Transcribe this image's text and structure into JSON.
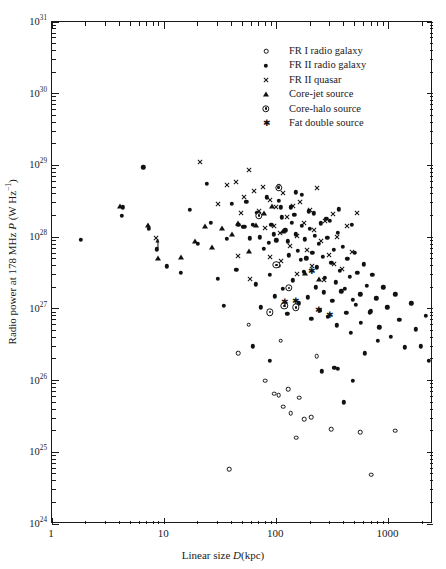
{
  "axes": {
    "x_title_prefix": "Linear size ",
    "x_title_symbol": "D",
    "x_title_suffix": "(kpc)",
    "y_title_prefix": "Radio power at 178 MHz ",
    "y_title_symbol": "P",
    "y_title_suffix": " (W Hz",
    "y_title_exp": "−1",
    "y_title_close": ")",
    "x_ticklabels": [
      "1",
      "10",
      "100",
      "1000"
    ],
    "y_ticklabels": [
      "10",
      "10",
      "10",
      "10",
      "10",
      "10",
      "10",
      "10"
    ],
    "y_tickexps": [
      "24",
      "25",
      "26",
      "27",
      "28",
      "29",
      "30",
      "31"
    ]
  },
  "legend": {
    "entries": [
      {
        "label": "FR I radio galaxy",
        "marker": "open-circle"
      },
      {
        "label": "FR II radio galaxy",
        "marker": "filled-circle"
      },
      {
        "label": "FR II quasar",
        "marker": "cross"
      },
      {
        "label": "Core-jet source",
        "marker": "triangle"
      },
      {
        "label": "Core-halo source",
        "marker": "core-halo"
      },
      {
        "label": "Fat double source",
        "marker": "star"
      }
    ]
  },
  "chart_data": {
    "type": "scatter",
    "title": "",
    "xlabel": "Linear size D (kpc)",
    "ylabel": "Radio power at 178 MHz P (W Hz^-1)",
    "xscale": "log",
    "yscale": "log",
    "xlim": [
      1,
      2500
    ],
    "ylim": [
      1e+24,
      1e+31
    ],
    "grid": false,
    "legend_position": "top-right",
    "series": [
      {
        "name": "FR I radio galaxy",
        "marker": "open-circle",
        "points": [
          [
            57,
            6e+26
          ],
          [
            110,
            3.6e+26
          ],
          [
            46,
            2.4e+26
          ],
          [
            230,
            2.2e+26
          ],
          [
            80,
            1e+26
          ],
          [
            128,
            7.6e+25
          ],
          [
            96,
            6.6e+25
          ],
          [
            105,
            6.3e+25
          ],
          [
            160,
            5.8e+25
          ],
          [
            116,
            4.3e+25
          ],
          [
            135,
            3.5e+25
          ],
          [
            205,
            3.1e+25
          ],
          [
            178,
            2.9e+25
          ],
          [
            150,
            1.6e+25
          ],
          [
            310,
            2.1e+25
          ],
          [
            560,
            1.9e+25
          ],
          [
            1150,
            2e+25
          ],
          [
            700,
            4.9e+24
          ],
          [
            38,
            5.8e+24
          ]
        ]
      },
      {
        "name": "FR II radio galaxy",
        "marker": "filled-circle",
        "points": [
          [
            1.8,
            9.2e+27
          ],
          [
            6.5,
            9.4e+28
          ],
          [
            4.2,
            2e+28
          ],
          [
            4.3,
            2.6e+28
          ],
          [
            7.3,
            1.3e+28
          ],
          [
            8.6,
            6.8e+27
          ],
          [
            10.5,
            3.9e+27
          ],
          [
            14,
            3.2e+27
          ],
          [
            24,
            5.5e+28
          ],
          [
            40,
            2.9e+28
          ],
          [
            46,
            1.5e+28
          ],
          [
            50,
            1.4e+28
          ],
          [
            52,
            1.4e+28
          ],
          [
            58,
            9.6e+27
          ],
          [
            62,
            1.5e+28
          ],
          [
            71,
            1e+28
          ],
          [
            77,
            6.9e+27
          ],
          [
            86,
            8.4e+27
          ],
          [
            90,
            1.5e+28
          ],
          [
            95,
            1.1e+28
          ],
          [
            100,
            9e+27
          ],
          [
            104,
            4e+27
          ],
          [
            110,
            2.6e+28
          ],
          [
            112,
            1.9e+28
          ],
          [
            120,
            1.25e+28
          ],
          [
            126,
            8.8e+27
          ],
          [
            130,
            5.6e+27
          ],
          [
            138,
            1.6e+28
          ],
          [
            145,
            2.05e+28
          ],
          [
            150,
            1.1e+28
          ],
          [
            156,
            6.4e+27
          ],
          [
            165,
            4.8e+27
          ],
          [
            170,
            1.45e+28
          ],
          [
            180,
            9.3e+27
          ],
          [
            186,
            5.1e+27
          ],
          [
            195,
            2.3e+28
          ],
          [
            200,
            1.3e+28
          ],
          [
            210,
            6.1e+27
          ],
          [
            220,
            1.05e+28
          ],
          [
            230,
            3.8e+27
          ],
          [
            240,
            8.1e+27
          ],
          [
            250,
            1.55e+28
          ],
          [
            260,
            5.3e+27
          ],
          [
            270,
            2.7e+27
          ],
          [
            285,
            9.8e+27
          ],
          [
            300,
            1.7e+28
          ],
          [
            310,
            4.4e+27
          ],
          [
            325,
            6.7e+27
          ],
          [
            340,
            2.35e+27
          ],
          [
            355,
            1.15e+28
          ],
          [
            370,
            3.4e+27
          ],
          [
            390,
            7.4e+27
          ],
          [
            410,
            1.9e+27
          ],
          [
            430,
            5e+27
          ],
          [
            455,
            2.8e+27
          ],
          [
            480,
            1.35e+27
          ],
          [
            500,
            6e+27
          ],
          [
            530,
            3.2e+27
          ],
          [
            560,
            1.6e+27
          ],
          [
            600,
            4.2e+27
          ],
          [
            640,
            2.1e+27
          ],
          [
            680,
            9e+26
          ],
          [
            720,
            3e+27
          ],
          [
            780,
            1.4e+27
          ],
          [
            830,
            5.5e+26
          ],
          [
            900,
            2e+27
          ],
          [
            980,
            1.05e+27
          ],
          [
            1050,
            4.1e+26
          ],
          [
            1150,
            1.6e+27
          ],
          [
            1250,
            7e+26
          ],
          [
            1400,
            2.9e+26
          ],
          [
            1600,
            1.2e+27
          ],
          [
            1750,
            5.2e+26
          ],
          [
            1950,
            3e+26
          ],
          [
            2150,
            8e+26
          ],
          [
            2300,
            1.9e+26
          ],
          [
            30,
            2.6e+27
          ],
          [
            34,
            1.1e+27
          ],
          [
            44,
            3.5e+27
          ],
          [
            66,
            2.2e+27
          ],
          [
            73,
            1.05e+27
          ],
          [
            88,
            3e+27
          ],
          [
            97,
            1.5e+27
          ],
          [
            115,
            1.9e+27
          ],
          [
            125,
            8.5e+26
          ],
          [
            140,
            2.5e+27
          ],
          [
            158,
            1.2e+27
          ],
          [
            175,
            3.3e+27
          ],
          [
            190,
            1.45e+27
          ],
          [
            205,
            7.2e+26
          ],
          [
            225,
            2e+27
          ],
          [
            245,
            9.5e+26
          ],
          [
            265,
            1.7e+27
          ],
          [
            290,
            7.8e+26
          ],
          [
            315,
            1.3e+27
          ],
          [
            345,
            5.9e+26
          ],
          [
            380,
            1.75e+27
          ],
          [
            420,
            8.8e+26
          ],
          [
            465,
            4.6e+26
          ],
          [
            510,
            1.15e+27
          ],
          [
            570,
            6.4e+26
          ],
          [
            620,
            2.4e+26
          ],
          [
            700,
            9.2e+26
          ],
          [
            800,
            3.6e+26
          ],
          [
            17,
            2.4e+28
          ],
          [
            20,
            8e+27
          ],
          [
            26,
            1.6e+28
          ],
          [
            36,
            9.5e+27
          ],
          [
            54,
            3.1e+28
          ],
          [
            68,
            2.2e+28
          ],
          [
            82,
            3.6e+28
          ],
          [
            105,
            3.2e+28
          ],
          [
            135,
            2.6e+28
          ],
          [
            168,
            3.9e+28
          ],
          [
            215,
            2.15e+28
          ],
          [
            280,
            1.8e+28
          ],
          [
            360,
            2.45e+28
          ],
          [
            470,
            1.5e+28
          ],
          [
            105,
            5.1e+28
          ],
          [
            150,
            4.2e+28
          ],
          [
            62,
            3e+26
          ],
          [
            88,
            1.9e+26
          ],
          [
            255,
            1.35e+26
          ],
          [
            330,
            1.5e+26
          ],
          [
            355,
            1.45e+26
          ],
          [
            480,
            1e+26
          ],
          [
            400,
            5e+25
          ]
        ]
      },
      {
        "name": "FR II quasar",
        "marker": "cross",
        "points": [
          [
            8.5,
            9.6e+27
          ],
          [
            21,
            1.1e+29
          ],
          [
            30,
            2.9e+28
          ],
          [
            36,
            5.3e+28
          ],
          [
            44,
            5.8e+28
          ],
          [
            48,
            2.15e+28
          ],
          [
            52,
            3.6e+28
          ],
          [
            57,
            8.5e+28
          ],
          [
            63,
            4.4e+28
          ],
          [
            70,
            2.3e+28
          ],
          [
            76,
            5e+28
          ],
          [
            80,
            1.35e+28
          ],
          [
            88,
            3.3e+28
          ],
          [
            95,
            1.45e+28
          ],
          [
            100,
            2.6e+28
          ],
          [
            108,
            1.15e+28
          ],
          [
            116,
            4.1e+28
          ],
          [
            125,
            1.9e+28
          ],
          [
            133,
            7.6e+27
          ],
          [
            142,
            2.75e+28
          ],
          [
            152,
            1.05e+28
          ],
          [
            163,
            3.05e+28
          ],
          [
            175,
            1.55e+28
          ],
          [
            188,
            6.6e+27
          ],
          [
            200,
            2.4e+28
          ],
          [
            215,
            1.25e+28
          ],
          [
            232,
            4.8e+28
          ],
          [
            250,
            8.8e+27
          ],
          [
            270,
            1.7e+28
          ],
          [
            295,
            5.6e+27
          ],
          [
            320,
            2.1e+28
          ],
          [
            350,
            1e+28
          ],
          [
            385,
            3.6e+27
          ],
          [
            425,
            1.45e+28
          ],
          [
            470,
            6.2e+27
          ],
          [
            520,
            2.2e+28
          ],
          [
            110,
            4.6e+27
          ],
          [
            152,
            3.1e+27
          ],
          [
            210,
            3.9e+27
          ],
          [
            265,
            2.5e+27
          ],
          [
            88,
            5.3e+27
          ],
          [
            58,
            2.6e+27
          ],
          [
            46,
            5.5e+27
          ],
          [
            330,
            4.2e+27
          ]
        ]
      },
      {
        "name": "Core-jet source",
        "marker": "triangle",
        "points": [
          [
            4.0,
            2.7e+28
          ],
          [
            7.2,
            1.5e+28
          ],
          [
            8.8,
            5.2e+27
          ],
          [
            14,
            5.3e+27
          ],
          [
            19,
            8.8e+27
          ],
          [
            23,
            1.45e+28
          ],
          [
            27,
            7.2e+27
          ],
          [
            33,
            1.35e+28
          ],
          [
            40,
            1.1e+28
          ],
          [
            46,
            1.6e+28
          ],
          [
            57,
            6.5e+27
          ],
          [
            66,
            1.5e+28
          ],
          [
            78,
            2.2e+28
          ],
          [
            92,
            2.7e+28
          ],
          [
            115,
            1.2e+28
          ],
          [
            180,
            3.2e+27
          ],
          [
            240,
            2.6e+27
          ]
        ]
      },
      {
        "name": "Core-halo source",
        "marker": "core-halo",
        "points": [
          [
            70,
            2e+28
          ],
          [
            105,
            4.9e+28
          ],
          [
            100,
            4.1e+27
          ],
          [
            118,
            1.1e+27
          ],
          [
            130,
            1.95e+27
          ],
          [
            88,
            9e+26
          ],
          [
            150,
            1.05e+27
          ]
        ]
      },
      {
        "name": "Fat double source",
        "marker": "star",
        "points": [
          [
            150,
            1.3e+27
          ],
          [
            205,
            3.4e+27
          ],
          [
            240,
            9.6e+26
          ],
          [
            300,
            8.2e+26
          ],
          [
            118,
            1.25e+27
          ]
        ]
      },
      {
        "name": "upper-limit",
        "marker": "arrow",
        "points": [
          [
            8.8,
            8e+27
          ]
        ]
      }
    ]
  }
}
